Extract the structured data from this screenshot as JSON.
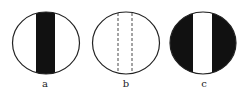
{
  "figures": [
    {
      "label": "a",
      "description": "white circle with black vertical band"
    },
    {
      "label": "b",
      "description": "white circle with two dashed vertical lines"
    },
    {
      "label": "c",
      "description": "black circle with white vertical band"
    }
  ],
  "colors": {
    "ink": "#111111",
    "paper": "#ffffff"
  }
}
